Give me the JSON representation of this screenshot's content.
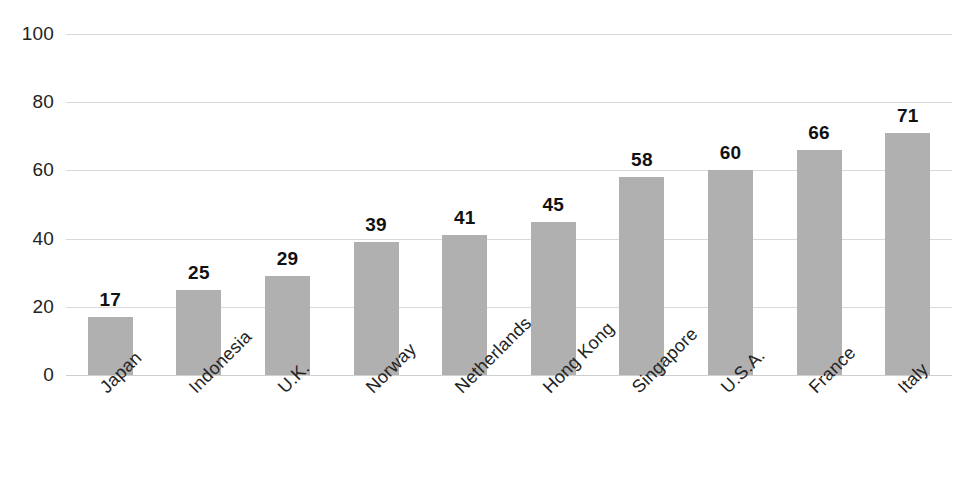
{
  "chart_data": {
    "type": "bar",
    "title": "",
    "subtitle": "",
    "xlabel": "",
    "ylabel": "",
    "ylim": [
      0,
      100
    ],
    "y_ticks": [
      0,
      20,
      40,
      60,
      80,
      100
    ],
    "grid": "horizontal",
    "legend": "none",
    "bar_color": "#b0b0b0",
    "gridline_color": "#d9d9d9",
    "label_color": "#111111",
    "background": "#ffffff",
    "categories": [
      "Japan",
      "Indonesia",
      "U.K.",
      "Norway",
      "Netherlands",
      "Hong Kong",
      "Singapore",
      "U.S.A.",
      "France",
      "Italy"
    ],
    "values": [
      17,
      25,
      29,
      39,
      41,
      45,
      58,
      60,
      66,
      71
    ],
    "value_labels": [
      "17",
      "25",
      "29",
      "39",
      "41",
      "45",
      "58",
      "60",
      "66",
      "71"
    ],
    "tick_labels": [
      "0",
      "20",
      "40",
      "60",
      "80",
      "100"
    ]
  }
}
